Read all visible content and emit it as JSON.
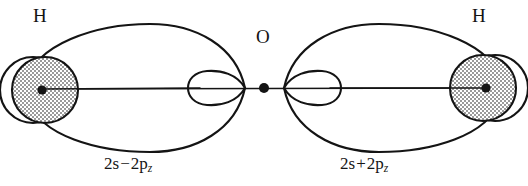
{
  "figure": {
    "kind": "molecular-orbital-diagram",
    "molecule": "H2O",
    "width": 528,
    "height": 186,
    "background_color": "#ffffff",
    "stroke_color": "#141414"
  },
  "atoms": {
    "oxygen": {
      "label": "O",
      "nucleus": {
        "x": 264,
        "y": 88
      }
    },
    "hydrogen_left": {
      "label": "H",
      "nucleus": {
        "x": 42,
        "y": 90
      },
      "shaded_circle": {
        "cx": 45,
        "cy": 90,
        "r": 33,
        "fill": "stipple-gray"
      },
      "outline_circle": {
        "cx": 33,
        "cy": 90,
        "r": 33
      }
    },
    "hydrogen_right": {
      "label": "H",
      "nucleus": {
        "x": 486,
        "y": 88
      },
      "shaded_circle": {
        "cx": 483,
        "cy": 88,
        "r": 33,
        "fill": "stipple-gray"
      },
      "outline_circle": {
        "cx": 495,
        "cy": 88,
        "r": 33
      }
    }
  },
  "orbitals": {
    "left": {
      "caption_prefix": "2s",
      "caption_operator": "−",
      "caption_base": "2p",
      "caption_subscript": "z",
      "caption_full": "2s − 2p₂",
      "large_lobe": {
        "tip_x": 245,
        "far_x": 27,
        "top_y": 24,
        "bottom_y": 152
      },
      "small_lobe": {
        "tip_x": 245,
        "far_x": 190,
        "top_y": 72,
        "bottom_y": 104
      }
    },
    "right": {
      "caption_prefix": "2s",
      "caption_operator": "+",
      "caption_base": "2p",
      "caption_subscript": "z",
      "caption_full": "2s + 2p₂",
      "large_lobe": {
        "tip_x": 284,
        "far_x": 501,
        "top_y": 24,
        "bottom_y": 152
      },
      "small_lobe": {
        "tip_x": 284,
        "far_x": 339,
        "top_y": 72,
        "bottom_y": 104
      }
    }
  },
  "bond_axis": {
    "x1": 42,
    "x2": 486,
    "y": 88
  }
}
